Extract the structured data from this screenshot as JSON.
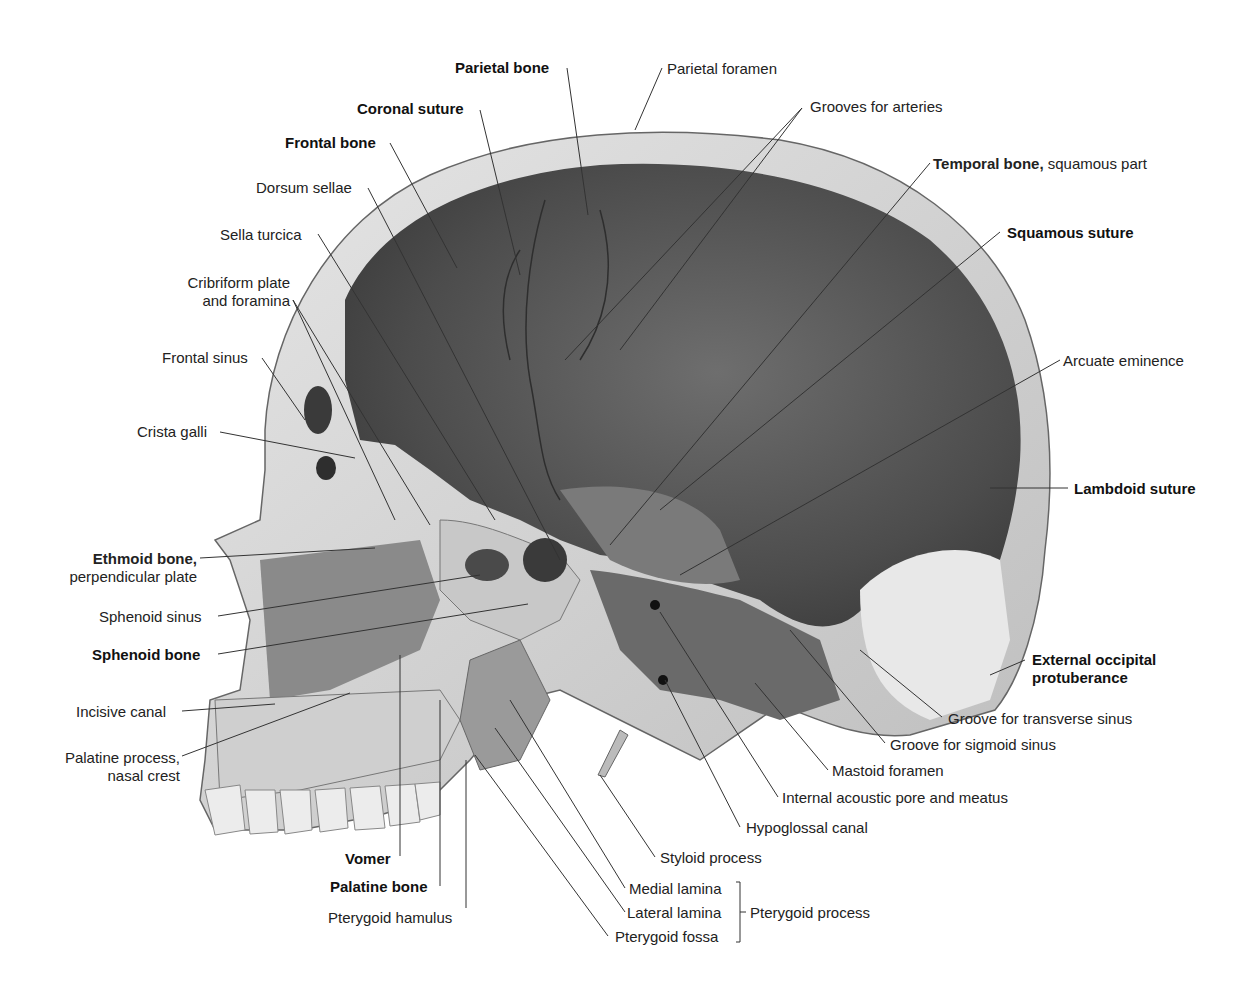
{
  "figure": {
    "labels": {
      "parietal_bone": "Parietal bone",
      "parietal_foramen": "Parietal foramen",
      "coronal_suture": "Coronal suture",
      "grooves_for_arteries": "Grooves for arteries",
      "frontal_bone": "Frontal bone",
      "temporal_bone": "Temporal bone,",
      "temporal_bone_part": " squamous part",
      "dorsum_sellae": "Dorsum sellae",
      "sella_turcica": "Sella turcica",
      "squamous_suture": "Squamous suture",
      "cribriform_1": "Cribriform plate",
      "cribriform_2": "and foramina",
      "frontal_sinus": "Frontal sinus",
      "arcuate_eminence": "Arcuate eminence",
      "crista_galli": "Crista galli",
      "lambdoid_suture": "Lambdoid suture",
      "ethmoid_bone": "Ethmoid bone,",
      "ethmoid_part": "perpendicular plate",
      "sphenoid_sinus": "Sphenoid sinus",
      "sphenoid_bone": "Sphenoid bone",
      "ext_occ_1": "External occipital",
      "ext_occ_2": "protuberance",
      "incisive_canal": "Incisive canal",
      "groove_transverse": "Groove for transverse sinus",
      "palatine_process_1": "Palatine process,",
      "palatine_process_2": "nasal crest",
      "groove_sigmoid": "Groove for sigmoid sinus",
      "mastoid_foramen": "Mastoid foramen",
      "internal_acoustic": "Internal acoustic pore and meatus",
      "hypoglossal_canal": "Hypoglossal canal",
      "styloid_process": "Styloid process",
      "vomer": "Vomer",
      "palatine_bone": "Palatine bone",
      "pterygoid_hamulus": "Pterygoid hamulus",
      "medial_lamina": "Medial lamina",
      "lateral_lamina": "Lateral lamina",
      "pterygoid_fossa": "Pterygoid fossa",
      "pterygoid_process": "Pterygoid process"
    },
    "colors": {
      "bone_light": "#d9d9d9",
      "bone_mid": "#9a9a9a",
      "cavity_dark": "#4a4a4a",
      "leader": "#333333"
    }
  }
}
